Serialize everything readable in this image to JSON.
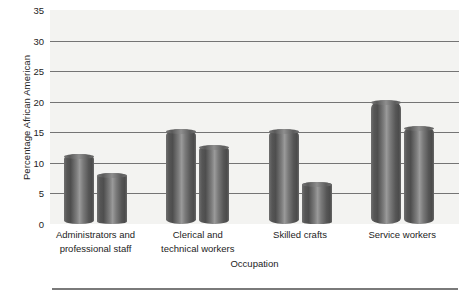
{
  "chart_data": {
    "type": "bar",
    "title": "",
    "subtitle": "",
    "xlabel": "Occupation",
    "ylabel": "Percentage African American",
    "ylim": [
      0,
      35
    ],
    "yticks": [
      0,
      5,
      10,
      15,
      20,
      25,
      30,
      35
    ],
    "ytick_labels": [
      "0",
      "5",
      "10",
      "15",
      "20",
      "25",
      "30",
      "35"
    ],
    "gridlines": [
      5,
      10,
      15,
      20,
      25,
      30
    ],
    "grid": true,
    "legend": "none",
    "legend_position": "none",
    "categories": [
      "Administrators and professional staff",
      "Clerical and technical workers",
      "Skilled crafts",
      "Service workers"
    ],
    "category_lines": [
      [
        "Administrators and",
        "professional staff"
      ],
      [
        "Clerical and",
        "technical workers"
      ],
      [
        "Skilled crafts",
        ""
      ],
      [
        "Service workers",
        ""
      ]
    ],
    "series": [
      {
        "name": "Series 1",
        "values": [
          11.5,
          15.5,
          15.5,
          20.3
        ]
      },
      {
        "name": "Series 2",
        "values": [
          8.3,
          12.9,
          6.8,
          16.0
        ]
      }
    ],
    "bar_style": "cylinder-3d",
    "bar_color": "#6a6a6a",
    "plot_background": "#f3f3f1",
    "gridline_color": "#4a4a4a",
    "text_color": "#232323"
  }
}
